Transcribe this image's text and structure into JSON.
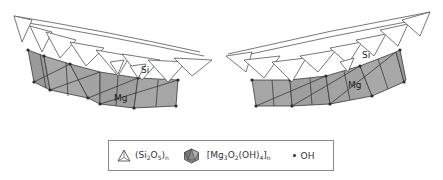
{
  "figure": {
    "type": "crystal-structure-diagram",
    "panels": [
      {
        "position": "left",
        "labels": {
          "tetrahedral_layer": "Si",
          "octahedral_layer": "Mg"
        },
        "curvature": "concave-up"
      },
      {
        "position": "right",
        "labels": {
          "tetrahedral_layer": "Si",
          "octahedral_layer": "Mg"
        },
        "curvature": "concave-up"
      }
    ],
    "colors": {
      "tetrahedra_fill": "#ffffff",
      "tetrahedra_stroke": "#555555",
      "octahedra_fill": "#9a9a9a",
      "octahedra_stroke": "#3a3a3a",
      "oh_dot": "#2b2b2b",
      "legend_border": "#8a8a8a"
    }
  },
  "labels": {
    "left_si": "Si",
    "left_mg": "Mg",
    "right_si": "Si",
    "right_mg": "Mg"
  },
  "legend": {
    "items": [
      {
        "icon": "tetrahedron-icon",
        "formula_prefix": "(Si",
        "sub1": "2",
        "mid": "O",
        "sub2": "5",
        "suffix": ")",
        "sub3": "n",
        "plain": "(Si2O5)n"
      },
      {
        "icon": "octahedron-icon",
        "formula_prefix": "[Mg",
        "sub1": "3",
        "mid": "O",
        "sub2": "2",
        "mid2": "(OH)",
        "sub3": "4",
        "suffix": "]",
        "sub4": "n",
        "plain": "[Mg3O2(OH)4]n"
      },
      {
        "icon": "dot-icon",
        "label": "OH"
      }
    ]
  }
}
